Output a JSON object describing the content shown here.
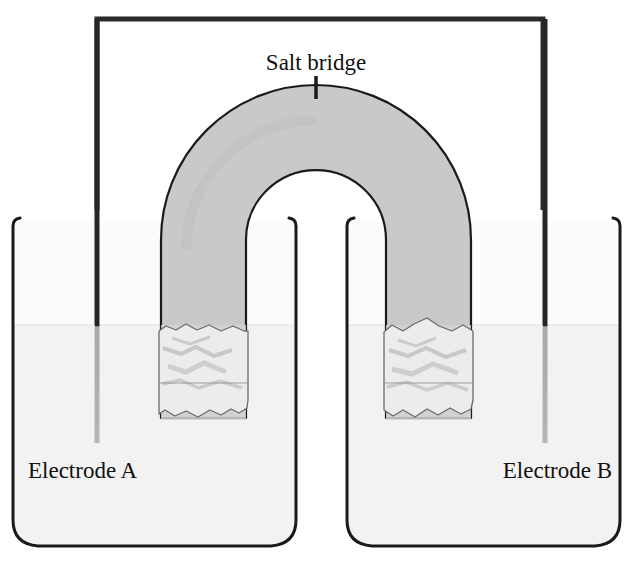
{
  "figure": {
    "type": "schematic-diagram",
    "width": 629,
    "height": 564,
    "background_color": "#ffffff"
  },
  "labels": {
    "salt_bridge": "Salt bridge",
    "electrode_a": "Electrode A",
    "electrode_b": "Electrode B"
  },
  "colors": {
    "outline": "#1a1a1a",
    "wire": "#2b2b2b",
    "salt_bridge_fill": "#c9c9c9",
    "salt_bridge_fill_submerged": "#d9d9d9",
    "solution_fill": "#f2f2f2",
    "beaker_fill": "#fbfbfb",
    "plug_fill": "#ececec",
    "plug_shadow": "#c4c4c4",
    "electrode_above": "#262626",
    "electrode_below": "#a8a8a8",
    "label_text": "#111111"
  },
  "components": {
    "wire": {
      "name": "external-circuit-wire",
      "path_points": "left electrode top -> up -> across top -> down -> right electrode top",
      "top_y": 16,
      "left_x": 95,
      "right_x": 545,
      "stroke_width": 5
    },
    "left_beaker": {
      "name": "beaker-left",
      "left_x": 13,
      "right_x": 296,
      "top_y": 218,
      "bottom_y": 546,
      "solution_level_y": 325
    },
    "right_beaker": {
      "name": "beaker-right",
      "left_x": 347,
      "right_x": 620,
      "top_y": 218,
      "bottom_y": 546,
      "solution_level_y": 325
    },
    "electrode_a": {
      "name": "electrode-a-rod",
      "x": 97,
      "top_y": 16,
      "bottom_y": 443,
      "width": 5
    },
    "electrode_b": {
      "name": "electrode-b-rod",
      "x": 545,
      "top_y": 16,
      "bottom_y": 443,
      "width": 5
    },
    "salt_bridge": {
      "name": "salt-bridge-u-tube",
      "center_x": 316,
      "arc_center_y": 240,
      "outer_radius": 155,
      "inner_radius": 70,
      "left_arm_outer_x": 161,
      "left_arm_inner_x": 246,
      "right_arm_inner_x": 386,
      "right_arm_outer_x": 471,
      "arm_bottom_y": 418,
      "solution_level_y": 325,
      "tick_mark_y_top": 76,
      "tick_mark_y_bottom": 97
    }
  },
  "annotations": [
    {
      "name": "salt-bridge-leader-tick",
      "text": "Salt bridge",
      "x": 316,
      "y": 70
    },
    {
      "name": "electrode-a-caption",
      "text": "Electrode A",
      "x": 28,
      "y": 478
    },
    {
      "name": "electrode-b-caption",
      "text": "Electrode B",
      "x": 478,
      "y": 478
    }
  ]
}
